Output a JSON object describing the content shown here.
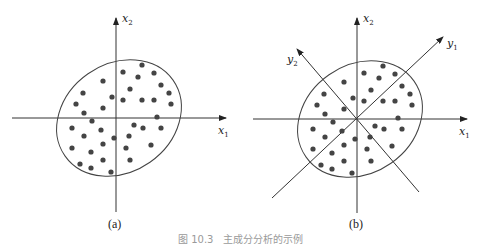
{
  "figure": {
    "caption": "图 10.3　主成分分析的示例",
    "colors": {
      "axis": "#333333",
      "dot": "#444444",
      "ellipse": "#444444"
    },
    "panels": [
      {
        "id": "a",
        "label": "(a)",
        "axes": [
          {
            "name": "x1",
            "text": "x",
            "sub": "1"
          },
          {
            "name": "x2",
            "text": "x",
            "sub": "2"
          }
        ]
      },
      {
        "id": "b",
        "label": "(b)",
        "axes": [
          {
            "name": "x1",
            "text": "x",
            "sub": "1"
          },
          {
            "name": "x2",
            "text": "x",
            "sub": "2"
          },
          {
            "name": "y1",
            "text": "y",
            "sub": "1"
          },
          {
            "name": "y2",
            "text": "y",
            "sub": "2"
          }
        ]
      }
    ],
    "points": [
      [
        142,
        65
      ],
      [
        123,
        72
      ],
      [
        154,
        73
      ],
      [
        138,
        77
      ],
      [
        103,
        81
      ],
      [
        161,
        85
      ],
      [
        130,
        89
      ],
      [
        83,
        93
      ],
      [
        169,
        93
      ],
      [
        112,
        97
      ],
      [
        123,
        100
      ],
      [
        142,
        100
      ],
      [
        154,
        100
      ],
      [
        76,
        104
      ],
      [
        171,
        104
      ],
      [
        103,
        108
      ],
      [
        84,
        113
      ],
      [
        157,
        117
      ],
      [
        92,
        121
      ],
      [
        134,
        125
      ],
      [
        143,
        128
      ],
      [
        161,
        128
      ],
      [
        72,
        128
      ],
      [
        101,
        130
      ],
      [
        84,
        136
      ],
      [
        129,
        136
      ],
      [
        114,
        138
      ],
      [
        103,
        144
      ],
      [
        151,
        145
      ],
      [
        72,
        148
      ],
      [
        126,
        148
      ],
      [
        91,
        152
      ],
      [
        80,
        164
      ],
      [
        91,
        168
      ],
      [
        103,
        160
      ],
      [
        130,
        160
      ],
      [
        111,
        172
      ]
    ]
  }
}
